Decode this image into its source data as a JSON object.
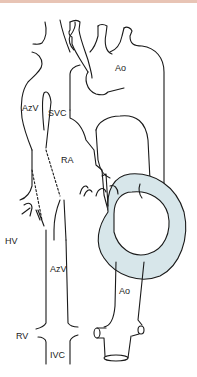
{
  "figure": {
    "type": "anatomical line diagram (heart and great vessels, posterior view)",
    "colors": {
      "stroke": "#1a1a1a",
      "ventricle_fill": "#d7e6ea",
      "top_band": "#e8c4b5"
    },
    "labels": {
      "ao_top": "Ao",
      "azv_top": "AzV",
      "svc": "SVC",
      "ra": "RA",
      "hv": "HV",
      "azv_bottom": "AzV",
      "rv": "RV",
      "ivc": "IVC",
      "ao_bottom": "Ao"
    }
  }
}
